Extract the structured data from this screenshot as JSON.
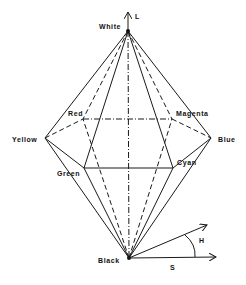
{
  "diagram": {
    "axis_labels": {
      "lightness": "L",
      "hue": "H",
      "saturation": "S"
    },
    "vertices": {
      "white": {
        "label": "White",
        "x": 128,
        "y": 31
      },
      "black": {
        "label": "Black",
        "x": 129,
        "y": 258
      },
      "yellow": {
        "label": "Yellow",
        "x": 45,
        "y": 138
      },
      "blue": {
        "label": "Blue",
        "x": 211,
        "y": 138
      },
      "red": {
        "label": "Red",
        "x": 83,
        "y": 119
      },
      "magenta": {
        "label": "Magenta",
        "x": 172,
        "y": 119
      },
      "green": {
        "label": "Green",
        "x": 84,
        "y": 168
      },
      "cyan": {
        "label": "Cyan",
        "x": 173,
        "y": 168
      }
    },
    "colors": {
      "line": "#1a1a1a",
      "background": "#ffffff"
    }
  }
}
